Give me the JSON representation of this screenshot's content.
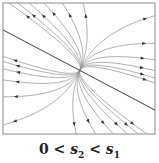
{
  "diagram": {
    "type": "phase-portrait",
    "caption": {
      "lhs": "0",
      "op1": " < ",
      "var1": "s",
      "sub1": "2",
      "op2": " < ",
      "var2": "s",
      "sub2": "1"
    },
    "colors": {
      "frame": "#8a8a8a",
      "trajectory": "#9a9a9a",
      "eigenline": "#555555",
      "arrow": "#333333"
    }
  }
}
